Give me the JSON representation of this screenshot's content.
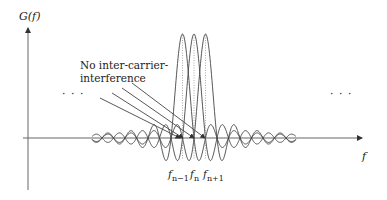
{
  "diagram": {
    "y_axis_label": "G(f)",
    "x_axis_label": "f",
    "annotation": {
      "line1": "No inter-carrier-",
      "line2": "interference"
    },
    "ellipsis_left": "· · ·",
    "ellipsis_right": "· · ·",
    "subcarrier_labels": [
      {
        "base": "f",
        "sub": "n−1"
      },
      {
        "base": "f",
        "sub": "n"
      },
      {
        "base": "f",
        "sub": "n+1"
      }
    ],
    "colors": {
      "curve": "#444444",
      "axis": "#555555",
      "arrow": "#444444",
      "center_line": "#888888"
    }
  }
}
